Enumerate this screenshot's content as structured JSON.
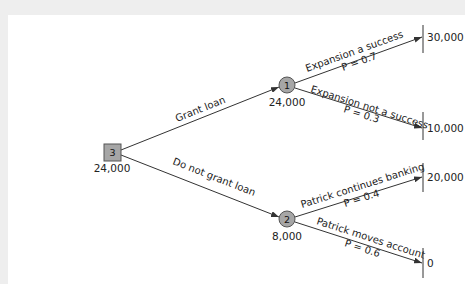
{
  "colors": {
    "line": "#333333",
    "node_fill": "#a6a6a6",
    "node_stroke": "#555555",
    "background": "#ffffff",
    "frame": "#eeeeee"
  },
  "decision_node": {
    "id": "3",
    "value": "24,000"
  },
  "branches": {
    "grant": {
      "label": "Grant loan"
    },
    "no_grant": {
      "label": "Do not grant loan"
    }
  },
  "chance_nodes": [
    {
      "id": "1",
      "value": "24,000",
      "outcomes": [
        {
          "label": "Expansion a success",
          "prob": "P = 0.7",
          "payoff": "30,000"
        },
        {
          "label": "Expansion not a success",
          "prob": "P = 0.3",
          "payoff": "10,000"
        }
      ]
    },
    {
      "id": "2",
      "value": "8,000",
      "outcomes": [
        {
          "label": "Patrick continues banking",
          "prob": "P = 0.4",
          "payoff": "20,000"
        },
        {
          "label": "Patrick moves account",
          "prob": "P = 0.6",
          "payoff": "0"
        }
      ]
    }
  ]
}
